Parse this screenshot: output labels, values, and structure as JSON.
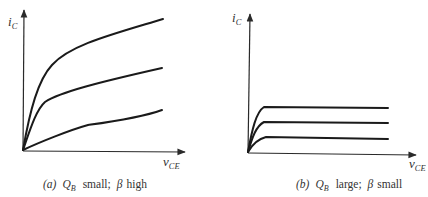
{
  "panels": [
    {
      "id": "a",
      "y_axis_label": "i",
      "y_axis_sub": "C",
      "x_axis_label": "v",
      "x_axis_sub": "CE",
      "caption": {
        "tag": "(a)",
        "q": "Q",
        "q_sub": "B",
        "q_desc": "small;",
        "beta": "β",
        "beta_desc": "high"
      }
    },
    {
      "id": "b",
      "y_axis_label": "i",
      "y_axis_sub": "C",
      "x_axis_label": "v",
      "x_axis_sub": "CE",
      "caption": {
        "tag": "(b)",
        "q": "Q",
        "q_sub": "B",
        "q_desc": "large;",
        "beta": "β",
        "beta_desc": "small"
      }
    }
  ],
  "colors": {
    "ink": "#1a1a1a",
    "background": "#ffffff"
  }
}
